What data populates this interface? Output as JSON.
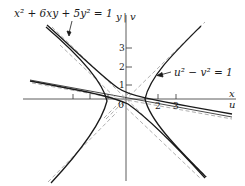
{
  "figure": {
    "equation_xy": "x² + 6xy + 5y² = 1",
    "equation_uv": "u² − v² = 1",
    "axes": {
      "horizontal_labels": [
        "x",
        "u"
      ],
      "vertical_labels": [
        "y",
        "v"
      ],
      "origin_label": "0",
      "vertical_ticks": [
        "1",
        "2",
        "3"
      ],
      "horizontal_ticks": [
        "2",
        "3"
      ]
    },
    "colors": {
      "curve": "#1a1a1a",
      "axis": "#333333",
      "asymptote": "#9a9a9a"
    }
  }
}
